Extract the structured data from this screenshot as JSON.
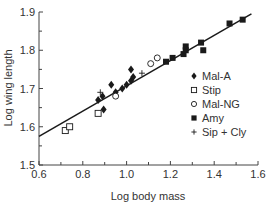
{
  "chart_data": {
    "type": "scatter",
    "title": "",
    "xlabel": "Log body mass",
    "ylabel": "Log wing length",
    "xlim": [
      0.6,
      1.6
    ],
    "ylim": [
      1.5,
      1.9
    ],
    "x_ticks": [
      "0.6",
      "0.8",
      "1.0",
      "1.2",
      "1.4",
      "1.6"
    ],
    "y_ticks": [
      "1.5",
      "1.6",
      "1.7",
      "1.8",
      "1.9"
    ],
    "grid": false,
    "legend_position": "lower right inside",
    "series": [
      {
        "name": "Mal-A",
        "marker": "filled-diamond",
        "points": [
          [
            0.87,
            1.67
          ],
          [
            0.89,
            1.68
          ],
          [
            0.895,
            1.645
          ],
          [
            0.93,
            1.71
          ],
          [
            0.95,
            1.69
          ],
          [
            0.98,
            1.7
          ],
          [
            1.0,
            1.71
          ],
          [
            1.02,
            1.72
          ],
          [
            1.02,
            1.75
          ],
          [
            1.03,
            1.73
          ]
        ]
      },
      {
        "name": "Stip",
        "marker": "open-square",
        "points": [
          [
            0.72,
            1.59
          ],
          [
            0.74,
            1.6
          ],
          [
            0.87,
            1.635
          ]
        ]
      },
      {
        "name": "Mal-NG",
        "marker": "open-circle",
        "points": [
          [
            0.95,
            1.68
          ],
          [
            1.11,
            1.765
          ],
          [
            1.14,
            1.78
          ]
        ]
      },
      {
        "name": "Amy",
        "marker": "filled-square",
        "points": [
          [
            1.18,
            1.77
          ],
          [
            1.21,
            1.78
          ],
          [
            1.26,
            1.79
          ],
          [
            1.27,
            1.8
          ],
          [
            1.27,
            1.81
          ],
          [
            1.34,
            1.82
          ],
          [
            1.35,
            1.8
          ],
          [
            1.47,
            1.87
          ],
          [
            1.53,
            1.88
          ]
        ]
      },
      {
        "name": "Sip + Cly",
        "marker": "plus",
        "points": [
          [
            0.88,
            1.69
          ],
          [
            1.07,
            1.74
          ]
        ]
      }
    ],
    "fit_line": {
      "x": [
        0.6,
        1.57
      ],
      "y": [
        1.575,
        1.895
      ]
    }
  },
  "legend": [
    {
      "label": "Mal-A",
      "marker": "filled-diamond"
    },
    {
      "label": "Stip",
      "marker": "open-square"
    },
    {
      "label": "Mal-NG",
      "marker": "open-circle"
    },
    {
      "label": "Amy",
      "marker": "filled-square"
    },
    {
      "label": "Sip + Cly",
      "marker": "plus"
    }
  ],
  "colors": {
    "ink": "#1a1a1a",
    "axis": "#444444"
  }
}
